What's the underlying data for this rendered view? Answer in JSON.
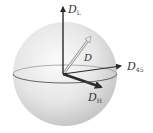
{
  "diagram": {
    "title": "",
    "colors": {
      "sphere_light": "#fafafa",
      "sphere_dark": "#c8c8c8",
      "axis": "#2a2a2a",
      "vector_d": "#9a9a9a",
      "equator": "#555555"
    },
    "labels": {
      "dl": {
        "main": "D",
        "sub": "L"
      },
      "d45": {
        "main": "D",
        "sub": "45"
      },
      "dh": {
        "main": "D",
        "sub": "H"
      },
      "d": {
        "main": "D"
      }
    },
    "nodes": [
      {
        "id": "origin",
        "role": "sphere-center"
      },
      {
        "id": "DL",
        "label": "D_L",
        "direction": "up"
      },
      {
        "id": "D45",
        "label": "D_45",
        "direction": "right"
      },
      {
        "id": "DH",
        "label": "D_H",
        "direction": "front-right-down"
      },
      {
        "id": "D",
        "label": "D",
        "direction": "oblique"
      }
    ],
    "edges": [
      {
        "from": "origin",
        "to": "DL",
        "style": "solid-arrow"
      },
      {
        "from": "origin",
        "to": "D45",
        "style": "solid-arrow"
      },
      {
        "from": "origin",
        "to": "DH",
        "style": "bold-arrow"
      },
      {
        "from": "origin",
        "to": "D",
        "style": "hollow-arrow"
      }
    ]
  }
}
